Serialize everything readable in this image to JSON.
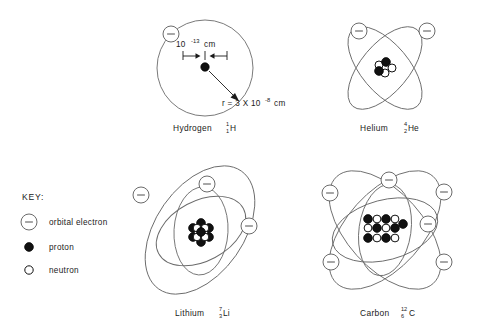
{
  "diagram": {
    "background_color": "#ffffff",
    "line_color": "#6b6b6b",
    "proton_color": "#111111",
    "neutron_color": "#ffffff",
    "text_color": "#1a1a1a"
  },
  "key": {
    "title": "KEY:",
    "items": [
      {
        "symbol": "orbital-electron-symbol",
        "label": "orbital electron"
      },
      {
        "symbol": "proton-symbol",
        "label": "proton"
      },
      {
        "symbol": "neutron-symbol",
        "label": "neutron"
      }
    ]
  },
  "atoms": [
    {
      "id": "hydrogen",
      "name": "Hydrogen",
      "element_symbol": "H",
      "mass_number": "1",
      "atomic_number": "1",
      "protons": 1,
      "neutrons": 0,
      "electrons": 1,
      "orbit_type": "circular",
      "annotations": {
        "nucleus_size_value": "10",
        "nucleus_size_exponent": "-13",
        "nucleus_size_unit": "cm",
        "radius_label": "r = 3 X 10",
        "radius_exponent": "-8",
        "radius_unit": "cm"
      }
    },
    {
      "id": "helium",
      "name": "Helium",
      "element_symbol": "He",
      "mass_number": "4",
      "atomic_number": "2",
      "protons": 2,
      "neutrons": 2,
      "electrons": 2,
      "orbit_type": "elliptical-crossed"
    },
    {
      "id": "lithium",
      "name": "Lithium",
      "element_symbol": "Li",
      "mass_number": "7",
      "atomic_number": "3",
      "protons": 3,
      "neutrons": 4,
      "electrons": 3,
      "orbit_type": "elliptical-crossed"
    },
    {
      "id": "carbon",
      "name": "Carbon",
      "element_symbol": "C",
      "mass_number": "12",
      "atomic_number": "6",
      "protons": 6,
      "neutrons": 6,
      "electrons": 6,
      "orbit_type": "elliptical-crossed"
    }
  ]
}
